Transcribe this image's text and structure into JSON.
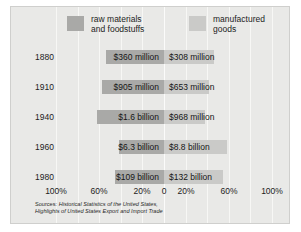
{
  "legend": {
    "raw": {
      "label_line1": "raw materials",
      "label_line2": "and foodstuffs",
      "color": "#a9a9a7"
    },
    "manufactured": {
      "label_line1": "manufactured",
      "label_line2": "goods",
      "color": "#cacac8"
    }
  },
  "axis": {
    "ticks": [
      "100%",
      "60%",
      "20%",
      "0",
      "20%",
      "60%",
      "100%"
    ],
    "tick_positions_px": [
      45,
      88,
      131,
      153,
      175,
      218,
      261
    ]
  },
  "rows": [
    {
      "year": "1880",
      "left_label": "$360 million",
      "right_label": "$308 million",
      "left_pct": 53.9,
      "right_pct": 46.1
    },
    {
      "year": "1910",
      "left_label": "$905 million",
      "right_label": "$653 million",
      "left_pct": 58.1,
      "right_pct": 41.9
    },
    {
      "year": "1940",
      "left_label": "$1.6 billion",
      "right_label": "$968 million",
      "left_pct": 62.3,
      "right_pct": 37.7
    },
    {
      "year": "1960",
      "left_label": "$6.3 billion",
      "right_label": "$8.8 billion",
      "left_pct": 41.7,
      "right_pct": 58.3
    },
    {
      "year": "1980",
      "left_label": "$109 billion",
      "right_label": "$132 billion",
      "left_pct": 45.2,
      "right_pct": 54.8
    }
  ],
  "sources": {
    "lead": "Sources: ",
    "line1": "Historical Statistics of the United States,",
    "line2": "Highlights of United States Export and Import Trade"
  },
  "chart_data": {
    "type": "bar",
    "title": "",
    "subtitle": "",
    "orientation": "horizontal-diverging",
    "categories": [
      "1880",
      "1910",
      "1940",
      "1960",
      "1980"
    ],
    "xlabel": "",
    "ylabel": "",
    "xlim": [
      -100,
      100
    ],
    "grid": true,
    "legend_position": "top",
    "tick_labels": [
      "100%",
      "60%",
      "20%",
      "0",
      "20%",
      "60%",
      "100%"
    ],
    "series": [
      {
        "name": "raw materials and foodstuffs",
        "direction": "left",
        "color": "#a9a9a7",
        "value_labels": [
          "$360 million",
          "$905 million",
          "$1.6 billion",
          "$6.3 billion",
          "$109 billion"
        ],
        "values_usd": [
          360000000,
          905000000,
          1600000000,
          6300000000,
          109000000000
        ],
        "percent_of_row": [
          53.9,
          58.1,
          62.3,
          41.7,
          45.2
        ]
      },
      {
        "name": "manufactured goods",
        "direction": "right",
        "color": "#cacac8",
        "value_labels": [
          "$308 million",
          "$653 million",
          "$968 million",
          "$8.8 billion",
          "$132 billion"
        ],
        "values_usd": [
          308000000,
          653000000,
          968000000,
          8800000000,
          132000000000
        ],
        "percent_of_row": [
          46.1,
          41.9,
          37.7,
          58.3,
          54.8
        ]
      }
    ],
    "notes": "Sources: Historical Statistics of the United States, Highlights of United States Export and Import Trade"
  }
}
